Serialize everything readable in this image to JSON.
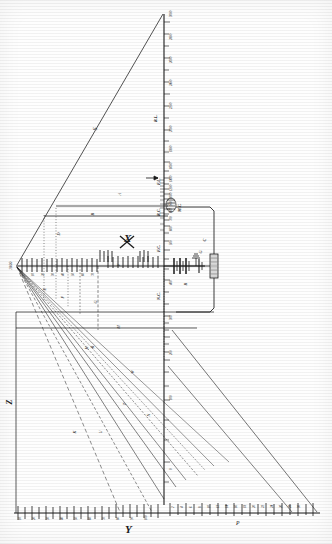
{
  "figure": {
    "kind": "engineering-nomograph",
    "orientation": "rotated-90",
    "background": "#fefefe",
    "ink": "#1a1a1a"
  },
  "axis_labels": {
    "x": "X",
    "y": "Y",
    "z": "Z",
    "v": "V",
    "w": "W",
    "a": "A",
    "b": "B",
    "c": "C",
    "d": "D",
    "e": "E",
    "f": "F",
    "g": "G",
    "h": "H",
    "k": "K",
    "m": "M",
    "n": "N",
    "p": "P",
    "r": "R",
    "s": "S",
    "t": "T",
    "u": "U"
  },
  "vertical_scale": {
    "name": "main-vertical-scale",
    "top_caption": "3000",
    "ticks": [
      "3000",
      "2800",
      "2600",
      "2400",
      "2200",
      "2000",
      "1800",
      "1600",
      "1400",
      "1200",
      "1000",
      "900",
      "800",
      "700",
      "600",
      "500",
      "400",
      "300",
      "200",
      "100",
      "0"
    ],
    "annotations": [
      "R.L.",
      "F.L.",
      "R.C.",
      "M.C.",
      "F.C.",
      "N.C."
    ]
  },
  "bottom_scale": {
    "name": "bottom-horizontal-scale",
    "left_section_label": "Y",
    "right_section_label": "P",
    "left_ticks": [
      "10",
      "20",
      "30",
      "40",
      "50",
      "60",
      "70",
      "80",
      "90",
      "100"
    ],
    "right_ticks": [
      "2",
      "4",
      "6",
      "8",
      "10",
      "12",
      "14",
      "16",
      "18",
      "20",
      "22",
      "24",
      "26",
      "28",
      "30"
    ]
  },
  "top_scale": {
    "name": "upper-horizontal-scale",
    "origin_label": "1000",
    "section_label": "X",
    "ticks": [
      "0",
      "10",
      "20",
      "30",
      "40",
      "50",
      "60",
      "70",
      "80",
      "90",
      "100",
      "110",
      "120"
    ]
  },
  "circuit": {
    "name": "electrical-circuit-inset",
    "battery_label": "B",
    "resistor_label": "C",
    "coil_label": "M.C.",
    "ground_label": "G"
  },
  "radiating_lines": {
    "origin": "convergence-point",
    "labels": [
      "S",
      "T",
      "U",
      "K",
      "H",
      "N",
      "W",
      "D",
      "E",
      "F",
      "G"
    ]
  },
  "caption": {
    "figure_number": "Fig. 1",
    "sheet": "Sheet 1"
  }
}
